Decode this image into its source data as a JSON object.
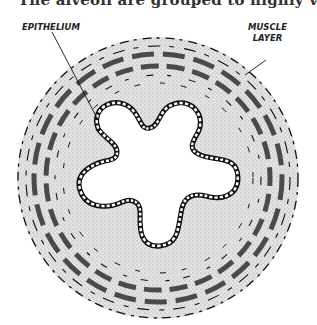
{
  "caption_fragment": "The alveoli are grouped to highly vegetative",
  "diagram": {
    "labels": {
      "epithelium": "EPITHELIUM",
      "muscle_line1": "MUSCLE",
      "muscle_line2": "LAYER"
    },
    "colors": {
      "stipple": "#d6d6d6",
      "muscle_band": "#4a4a4a",
      "outline": "#111111",
      "background": "#ffffff"
    }
  }
}
